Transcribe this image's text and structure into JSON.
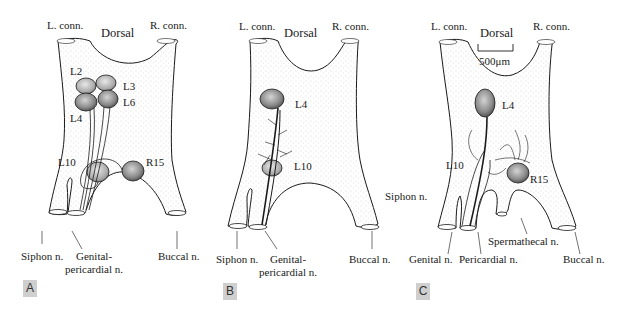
{
  "figure": {
    "panels": [
      {
        "tag": "A",
        "labels": {
          "l_conn": "L. conn.",
          "r_conn": "R. conn.",
          "dorsal": "Dorsal",
          "l2": "L2",
          "l3": "L3",
          "l4": "L4",
          "l6": "L6",
          "l10": "L10",
          "r15": "R15",
          "siphon": "Siphon n.",
          "genital_1": "Genital-",
          "genital_2": "pericardial n.",
          "buccal": "Buccal n."
        }
      },
      {
        "tag": "B",
        "labels": {
          "l_conn": "L. conn.",
          "r_conn": "R. conn.",
          "dorsal": "Dorsal",
          "l4": "L4",
          "l10": "L10",
          "siphon": "Siphon n.",
          "genital_1": "Genital-",
          "genital_2": "pericardial n.",
          "buccal": "Buccal n."
        }
      },
      {
        "tag": "C",
        "labels": {
          "l_conn": "L. conn.",
          "r_conn": "R. conn.",
          "dorsal": "Dorsal",
          "scale_bar": "500μm",
          "l4": "L4",
          "l10": "L10",
          "r15": "R15",
          "siphon": "Siphon n.",
          "spermathecal": "Spermathecal n.",
          "genital": "Genital n.",
          "pericardial": "Pericardial n.",
          "buccal": "Buccal n."
        }
      }
    ],
    "colors": {
      "outline": "#1a1a1a",
      "stipple": "#b8b8b8",
      "neuron_fill": "#8a8a8a",
      "tag_bg": "#cfcfcf"
    }
  }
}
